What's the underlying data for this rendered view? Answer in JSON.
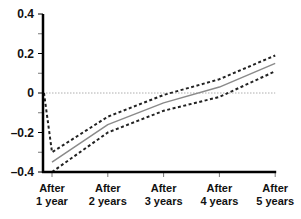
{
  "chart_data": {
    "type": "line",
    "title": "",
    "xlabel": "",
    "ylabel": "",
    "ylim": [
      -0.4,
      0.4
    ],
    "yticks": [
      0.4,
      0.2,
      0,
      -0.2,
      -0.4
    ],
    "ytick_labels": [
      "0.4",
      "0.2",
      "0",
      "–0.2",
      "–0.4"
    ],
    "categories": [
      [
        "After",
        "1 year"
      ],
      [
        "After",
        "2 years"
      ],
      [
        "After",
        "3 years"
      ],
      [
        "After",
        "4 years"
      ],
      [
        "After",
        "5 years"
      ]
    ],
    "x": [
      1,
      2,
      3,
      4,
      5
    ],
    "origin_start": {
      "upper_band": 0
    },
    "series": [
      {
        "name": "estimate",
        "style": "solid",
        "color": "#8a8a8a",
        "values": [
          -0.35,
          -0.16,
          -0.05,
          0.03,
          0.15
        ]
      },
      {
        "name": "upper bound",
        "style": "dashed",
        "color": "#222222",
        "values": [
          -0.3,
          -0.12,
          -0.01,
          0.07,
          0.19
        ]
      },
      {
        "name": "lower bound",
        "style": "dashed",
        "color": "#222222",
        "values": [
          -0.4,
          -0.2,
          -0.09,
          -0.02,
          0.11
        ]
      }
    ],
    "zero_line": {
      "style": "dotted",
      "color": "#999999"
    },
    "grid": false,
    "legend": "none"
  }
}
